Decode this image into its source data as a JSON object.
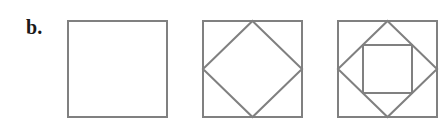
{
  "canvas": {
    "width": 447,
    "height": 123,
    "background_color": "#ffffff"
  },
  "panel": {
    "label": "b."
  },
  "style": {
    "stroke_color": "#808080",
    "stroke_width": 2,
    "label_color": "#1a1a1a"
  },
  "figures": [
    {
      "name": "figure-1-square",
      "index": 1,
      "description": "single outer square",
      "outer_square": {
        "x": 68,
        "y": 21,
        "width": 99,
        "height": 96
      },
      "shapes": [
        {
          "kind": "square",
          "points": "68,21 167,21 167,117 68,117"
        }
      ]
    },
    {
      "name": "figure-2-square-with-inscribed-diamond",
      "index": 2,
      "description": "outer square with one inscribed midpoint square (diamond)",
      "outer_square": {
        "x": 203,
        "y": 21,
        "width": 99,
        "height": 96
      },
      "shapes": [
        {
          "kind": "square",
          "points": "203,21 302,21 302,117 203,117"
        },
        {
          "kind": "diamond",
          "points": "252.5,21 302,69 252.5,117 203,69"
        }
      ]
    },
    {
      "name": "figure-3-square-with-diamond-and-inner-square",
      "index": 3,
      "description": "outer square, inscribed midpoint diamond, and innermost axis-aligned square inscribed in the diamond",
      "outer_square": {
        "x": 338,
        "y": 21,
        "width": 99,
        "height": 96
      },
      "inner_square": {
        "x": 363,
        "y": 45,
        "width": 49,
        "height": 48
      },
      "shapes": [
        {
          "kind": "square",
          "points": "338,21 437,21 437,117 338,117"
        },
        {
          "kind": "diamond",
          "points": "387.5,21 437,69 387.5,117 338,69"
        },
        {
          "kind": "square",
          "points": "363,45 412,45 412,93 363,93"
        }
      ]
    }
  ]
}
